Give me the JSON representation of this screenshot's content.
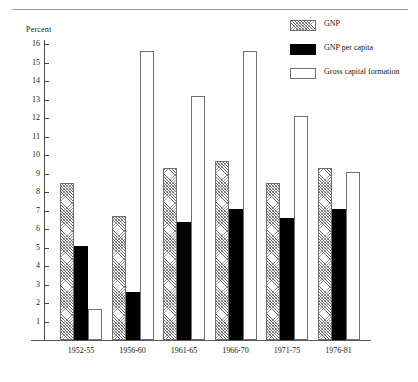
{
  "chart_data": {
    "type": "bar",
    "title": "",
    "xlabel": "",
    "ylabel": "Percent",
    "ylim": [
      0,
      16.6
    ],
    "yticks": [
      1,
      2,
      3,
      4,
      5,
      6,
      7,
      8,
      9,
      10,
      11,
      12,
      13,
      14,
      15,
      16
    ],
    "grid": false,
    "legend_position": "top-right",
    "categories": [
      "1952-55",
      "1956-60",
      "1961-65",
      "1966-70",
      "1971-75",
      "1976-81"
    ],
    "series": [
      {
        "name": "GNP",
        "fill": "hatched",
        "values": [
          8.5,
          6.7,
          9.3,
          9.7,
          8.5,
          9.3
        ]
      },
      {
        "name": "GNP per capita",
        "fill": "solid-black",
        "values": [
          5.1,
          2.6,
          6.4,
          7.1,
          6.6,
          7.1
        ]
      },
      {
        "name": "Gross capital formation",
        "fill": "white-outline",
        "values": [
          1.7,
          15.6,
          13.2,
          15.6,
          12.1,
          9.1
        ]
      }
    ]
  },
  "legend": {
    "items": [
      {
        "label": "GNP",
        "swatch": "hatched-swatch"
      },
      {
        "label": "GNP per capita",
        "swatch": "black-swatch"
      },
      {
        "label": "Gross capital formation",
        "swatch": "white-swatch"
      }
    ]
  },
  "colors": {
    "axis": "#4a4a4a",
    "bar_outline": "#6f6f6f",
    "bar_solid": "#000000",
    "background": "#ffffff"
  }
}
